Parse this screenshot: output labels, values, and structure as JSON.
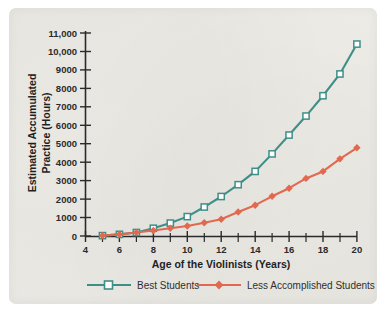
{
  "chart_data": {
    "type": "line",
    "title": "",
    "xlabel": "Age of the Violinists (Years)",
    "ylabel": "Estimated Accumulated Practice (Hours)",
    "ylabel_line1": "Estimated Accumulated",
    "ylabel_line2": "Practice (Hours)",
    "xlim": [
      4,
      20
    ],
    "ylim": [
      0,
      11000
    ],
    "grid": false,
    "legend_position": "bottom",
    "x": [
      5,
      6,
      7,
      8,
      9,
      10,
      11,
      12,
      13,
      14,
      15,
      16,
      17,
      18,
      19,
      20
    ],
    "x_tick_labels": [
      "4",
      "6",
      "8",
      "10",
      "12",
      "14",
      "16",
      "18",
      "20"
    ],
    "x_tick_values": [
      4,
      6,
      8,
      10,
      12,
      14,
      16,
      18,
      20
    ],
    "x_minor_ticks": [
      5,
      7,
      9,
      11,
      13,
      15,
      17,
      19
    ],
    "y_tick_labels": [
      "0",
      "1000",
      "2000",
      "3000",
      "4000",
      "5000",
      "6000",
      "7000",
      "8000",
      "9000",
      "10,000",
      "11,000"
    ],
    "y_tick_values": [
      0,
      1000,
      2000,
      3000,
      4000,
      5000,
      6000,
      7000,
      8000,
      9000,
      10000,
      11000
    ],
    "series": [
      {
        "name": "Best Students",
        "color": "#3f8f89",
        "marker": "open-square",
        "values": [
          20,
          90,
          190,
          420,
          700,
          1050,
          1570,
          2140,
          2780,
          3500,
          4450,
          5470,
          6500,
          7600,
          8780,
          10400
        ]
      },
      {
        "name": "Less Accomplished Students",
        "color": "#e0694f",
        "marker": "filled-diamond",
        "values": [
          20,
          90,
          190,
          300,
          420,
          540,
          720,
          910,
          1300,
          1670,
          2150,
          2590,
          3120,
          3500,
          4180,
          4780
        ]
      }
    ]
  },
  "legend": {
    "items": [
      {
        "label": "Best Students",
        "color": "#3f8f89",
        "marker": "open-square"
      },
      {
        "label": "Less Accomplished Students",
        "color": "#e0694f",
        "marker": "filled-diamond"
      }
    ]
  },
  "colors": {
    "best_students": "#3f8f89",
    "less_accomplished": "#e0694f",
    "axis": "#2a2a2a",
    "panel_background": "#ecebe6"
  }
}
